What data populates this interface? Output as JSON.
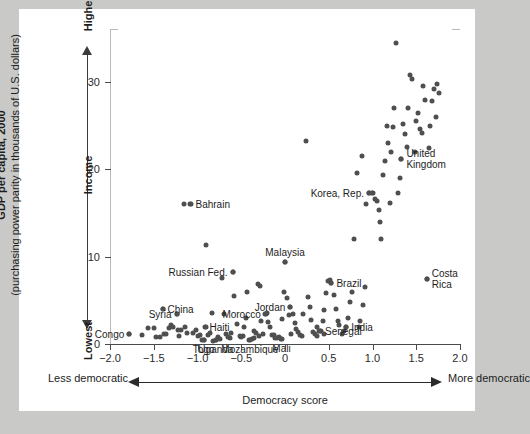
{
  "figure": {
    "y_axis": {
      "title_line1": "GDP per capita, 2000",
      "title_line2": "(purchasing power parity in thousands of U.S. dollars)",
      "direction_high": "Highest",
      "direction_mid": "Income",
      "direction_low": "Lowest",
      "ticks": [
        0,
        10,
        20,
        30
      ]
    },
    "x_axis": {
      "title": "Democracy score",
      "direction_low": "Less democratic",
      "direction_high": "More democratic",
      "ticks": [
        "−2.0",
        "−1.5",
        "−1.0",
        "−0.5",
        "0",
        "0.5",
        "1.0",
        "1.5",
        "2.0"
      ],
      "tick_values": [
        -2.0,
        -1.5,
        -1.0,
        -0.5,
        0,
        0.5,
        1.0,
        1.5,
        2.0
      ]
    },
    "colors": {
      "page_background": "#c9c9c7",
      "panel_background": "#ffffff",
      "marker": "#4f4f4f",
      "axis": "#4a4a4a",
      "frame": "#b9b9b9",
      "text": "#1d1d1d"
    }
  },
  "chart_data": {
    "type": "scatter",
    "title": "",
    "xlabel": "Democracy score",
    "ylabel": "GDP per capita, 2000 (purchasing power parity in thousands of U.S. dollars)",
    "xlim": [
      -2.0,
      2.0
    ],
    "ylim": [
      0,
      36
    ],
    "grid": false,
    "legend": null,
    "labeled_points": [
      {
        "name": "Congo",
        "x": -1.78,
        "y": 1.2,
        "pos": "l"
      },
      {
        "name": "Syria",
        "x": -1.24,
        "y": 3.4,
        "pos": "l"
      },
      {
        "name": "China",
        "x": -1.4,
        "y": 4.0,
        "pos": "r"
      },
      {
        "name": "Bahrain",
        "x": -1.08,
        "y": 16.0,
        "pos": "r"
      },
      {
        "name": "Russian Fed.",
        "x": -0.6,
        "y": 8.3,
        "pos": "l"
      },
      {
        "name": "Haiti",
        "x": -0.92,
        "y": 1.9,
        "pos": "r"
      },
      {
        "name": "Togo",
        "x": -0.93,
        "y": 0.5,
        "pos": "b"
      },
      {
        "name": "Uganda",
        "x": -0.79,
        "y": 0.5,
        "pos": "b"
      },
      {
        "name": "Mozambique",
        "x": -0.4,
        "y": 0.5,
        "pos": "b"
      },
      {
        "name": "Mali",
        "x": -0.04,
        "y": 0.6,
        "pos": "b"
      },
      {
        "name": "Morocco",
        "x": -0.22,
        "y": 3.4,
        "pos": "l"
      },
      {
        "name": "Malaysia",
        "x": 0.0,
        "y": 9.4,
        "pos": "t"
      },
      {
        "name": "Jordan",
        "x": 0.06,
        "y": 4.2,
        "pos": "l"
      },
      {
        "name": "Brazil",
        "x": 0.53,
        "y": 7.0,
        "pos": "r"
      },
      {
        "name": "Senegal",
        "x": 0.4,
        "y": 1.5,
        "pos": "r"
      },
      {
        "name": "India",
        "x": 0.7,
        "y": 1.9,
        "pos": "r"
      },
      {
        "name": "Korea, Rep.",
        "x": 0.96,
        "y": 17.3,
        "pos": "l"
      },
      {
        "name": "United\nKingdom",
        "x": 1.33,
        "y": 21.2,
        "pos": "r"
      },
      {
        "name": "Costa\nRica",
        "x": 1.62,
        "y": 7.4,
        "pos": "r"
      }
    ],
    "points": [
      [
        -1.78,
        1.2
      ],
      [
        -1.63,
        1.0
      ],
      [
        -1.57,
        1.8
      ],
      [
        -1.5,
        1.8
      ],
      [
        -1.47,
        0.8
      ],
      [
        -1.43,
        0.8
      ],
      [
        -1.4,
        4.0
      ],
      [
        -1.38,
        1.1
      ],
      [
        -1.36,
        1.1
      ],
      [
        -1.33,
        1.8
      ],
      [
        -1.3,
        2.2
      ],
      [
        -1.28,
        1.9
      ],
      [
        -1.24,
        3.4
      ],
      [
        -1.22,
        1.6
      ],
      [
        -1.19,
        1.6
      ],
      [
        -1.16,
        16.0
      ],
      [
        -1.14,
        2.0
      ],
      [
        -1.12,
        1.3
      ],
      [
        -1.09,
        16.0
      ],
      [
        -1.05,
        1.3
      ],
      [
        -1.02,
        1.6
      ],
      [
        -0.99,
        0.9
      ],
      [
        -0.97,
        1.0
      ],
      [
        -0.95,
        0.5
      ],
      [
        -0.93,
        0.5
      ],
      [
        -0.9,
        11.3
      ],
      [
        -0.9,
        1.9
      ],
      [
        -0.88,
        1.0
      ],
      [
        -0.86,
        1.3
      ],
      [
        -0.84,
        3.5
      ],
      [
        -0.82,
        0.4
      ],
      [
        -0.79,
        0.5
      ],
      [
        -0.77,
        0.8
      ],
      [
        -0.74,
        0.6
      ],
      [
        -0.72,
        7.6
      ],
      [
        -0.7,
        3.4
      ],
      [
        -0.68,
        1.2
      ],
      [
        -0.65,
        0.8
      ],
      [
        -0.63,
        0.7
      ],
      [
        -0.6,
        8.3
      ],
      [
        -0.58,
        5.5
      ],
      [
        -0.55,
        2.3
      ],
      [
        -0.52,
        0.9
      ],
      [
        -0.5,
        0.8
      ],
      [
        -0.48,
        0.9
      ],
      [
        -0.45,
        3.0
      ],
      [
        -0.43,
        6.0
      ],
      [
        -0.41,
        0.5
      ],
      [
        -0.38,
        0.6
      ],
      [
        -0.36,
        1.5
      ],
      [
        -0.33,
        1.3
      ],
      [
        -0.31,
        6.9
      ],
      [
        -0.29,
        6.6
      ],
      [
        -0.27,
        2.6
      ],
      [
        -0.25,
        1.1
      ],
      [
        -0.23,
        3.4
      ],
      [
        -0.21,
        3.5
      ],
      [
        -0.19,
        2.5
      ],
      [
        -0.17,
        2.0
      ],
      [
        -0.15,
        1.0
      ],
      [
        -0.13,
        1.0
      ],
      [
        -0.11,
        0.7
      ],
      [
        -0.09,
        0.7
      ],
      [
        -0.07,
        0.8
      ],
      [
        -0.05,
        0.6
      ],
      [
        -0.03,
        2.9
      ],
      [
        -0.01,
        5.9
      ],
      [
        0.0,
        9.4
      ],
      [
        0.02,
        5.3
      ],
      [
        0.04,
        3.3
      ],
      [
        0.06,
        4.2
      ],
      [
        0.09,
        3.4
      ],
      [
        0.11,
        2.4
      ],
      [
        0.13,
        1.7
      ],
      [
        0.15,
        1.4
      ],
      [
        0.17,
        1.0
      ],
      [
        0.19,
        0.9
      ],
      [
        0.21,
        3.4
      ],
      [
        0.24,
        23.2
      ],
      [
        0.26,
        5.4
      ],
      [
        0.28,
        4.2
      ],
      [
        0.3,
        2.7
      ],
      [
        0.32,
        1.4
      ],
      [
        0.34,
        1.1
      ],
      [
        0.36,
        0.9
      ],
      [
        0.39,
        1.5
      ],
      [
        0.41,
        1.5
      ],
      [
        0.43,
        2.6
      ],
      [
        0.45,
        3.9
      ],
      [
        0.47,
        5.8
      ],
      [
        0.49,
        7.2
      ],
      [
        0.51,
        7.3
      ],
      [
        0.53,
        7.0
      ],
      [
        0.56,
        5.6
      ],
      [
        0.58,
        4.0
      ],
      [
        0.6,
        2.6
      ],
      [
        0.62,
        2.2
      ],
      [
        0.65,
        1.1
      ],
      [
        0.67,
        1.5
      ],
      [
        0.7,
        1.9
      ],
      [
        0.72,
        3.0
      ],
      [
        0.74,
        4.8
      ],
      [
        0.77,
        6.0
      ],
      [
        0.79,
        12.0
      ],
      [
        0.82,
        19.6
      ],
      [
        0.84,
        2.0
      ],
      [
        0.86,
        2.6
      ],
      [
        0.89,
        4.5
      ],
      [
        0.91,
        6.5
      ],
      [
        0.93,
        16.0
      ],
      [
        0.96,
        17.3
      ],
      [
        0.99,
        17.3
      ],
      [
        1.01,
        17.3
      ],
      [
        1.03,
        16.6
      ],
      [
        1.05,
        16.4
      ],
      [
        1.07,
        15.3
      ],
      [
        1.08,
        14.0
      ],
      [
        1.1,
        12.0
      ],
      [
        1.12,
        19.4
      ],
      [
        1.14,
        21.0
      ],
      [
        1.16,
        25.0
      ],
      [
        1.18,
        23.0
      ],
      [
        1.21,
        22.0
      ],
      [
        1.23,
        24.8
      ],
      [
        1.25,
        27.0
      ],
      [
        1.27,
        34.5
      ],
      [
        1.29,
        17.3
      ],
      [
        1.31,
        19.0
      ],
      [
        1.33,
        21.2
      ],
      [
        1.35,
        25.2
      ],
      [
        1.37,
        24.0
      ],
      [
        1.39,
        22.6
      ],
      [
        1.41,
        27.0
      ],
      [
        1.43,
        30.8
      ],
      [
        1.45,
        30.4
      ],
      [
        1.48,
        22.0
      ],
      [
        1.5,
        25.5
      ],
      [
        1.52,
        26.5
      ],
      [
        1.54,
        24.6
      ],
      [
        1.56,
        24.2
      ],
      [
        1.58,
        29.5
      ],
      [
        1.6,
        28.0
      ],
      [
        1.62,
        7.4
      ],
      [
        1.64,
        22.5
      ],
      [
        1.66,
        25.0
      ],
      [
        1.68,
        27.8
      ],
      [
        1.7,
        29.2
      ],
      [
        1.72,
        26.0
      ],
      [
        1.74,
        29.8
      ],
      [
        1.76,
        28.8
      ],
      [
        -1.21,
        0.9
      ],
      [
        -0.62,
        1.3
      ],
      [
        -0.47,
        2.0
      ],
      [
        0.07,
        1.2
      ],
      [
        0.37,
        2.0
      ],
      [
        1.2,
        16.2
      ],
      [
        0.88,
        21.5
      ],
      [
        -0.35,
        0.7
      ],
      [
        -0.3,
        0.9
      ],
      [
        0.44,
        1.2
      ]
    ]
  }
}
